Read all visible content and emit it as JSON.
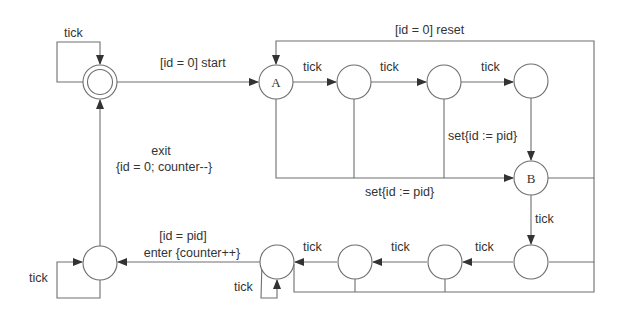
{
  "diagram": {
    "type": "state-machine",
    "states": [
      {
        "id": "init",
        "label": "",
        "initial": true
      },
      {
        "id": "A",
        "label": "A"
      },
      {
        "id": "s2",
        "label": ""
      },
      {
        "id": "s3",
        "label": ""
      },
      {
        "id": "s4",
        "label": ""
      },
      {
        "id": "B",
        "label": "B"
      },
      {
        "id": "s6",
        "label": ""
      },
      {
        "id": "s7",
        "label": ""
      },
      {
        "id": "s8",
        "label": ""
      },
      {
        "id": "s9",
        "label": ""
      },
      {
        "id": "s10",
        "label": ""
      }
    ],
    "labels": {
      "init_loop": "tick",
      "start": "[id = 0] start",
      "reset": "[id = 0] reset",
      "tick_A_s2": "tick",
      "tick_s2_s3": "tick",
      "tick_s3_s4": "tick",
      "set_s4_B": "set{id := pid}",
      "set_A_B": "set{id := pid}",
      "tick_B_s6": "tick",
      "tick_s6_s7": "tick",
      "tick_s7_s8": "tick",
      "tick_s8_s9": "tick",
      "s9_loop": "tick",
      "enter_guard": "[id = pid]",
      "enter_action": "enter {counter++}",
      "s10_loop": "tick",
      "exit_event": "exit",
      "exit_action": "{id = 0; counter--}"
    }
  }
}
